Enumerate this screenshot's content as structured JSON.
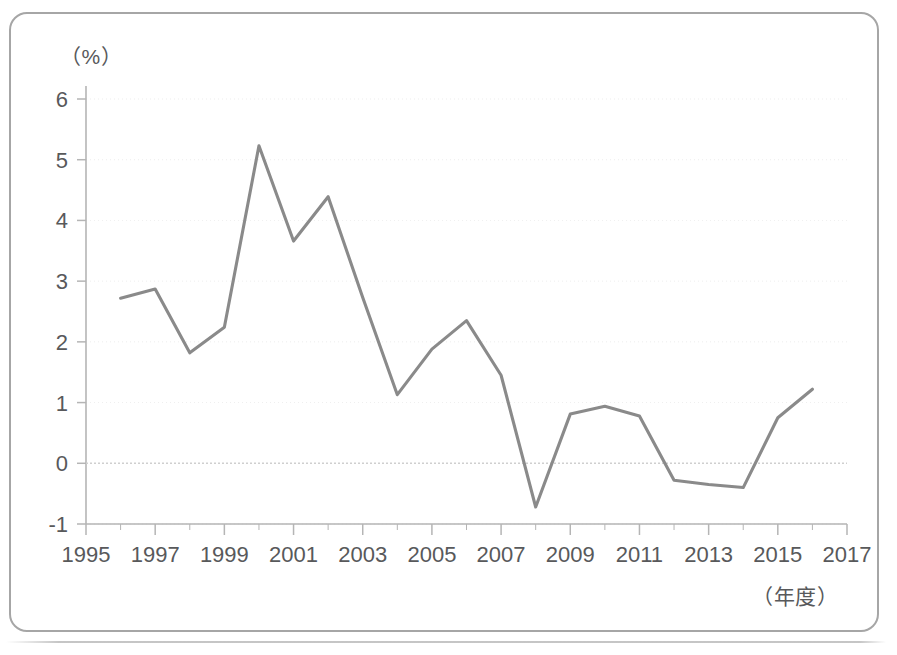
{
  "chart_data": {
    "type": "line",
    "title": "",
    "subtitle": "",
    "xlabel": "（年度）",
    "ylabel": "（%）",
    "unit_label": "（%）",
    "xaxis_caption": "（年度）",
    "grid": true,
    "legend": null,
    "legend_position": "none",
    "xlim": [
      1995,
      2017
    ],
    "ylim": [
      -1,
      6
    ],
    "ytick_labels": [
      "6",
      "5",
      "4",
      "3",
      "2",
      "1",
      "0",
      "-1"
    ],
    "ytick_values": [
      6,
      5,
      4,
      3,
      2,
      1,
      0,
      -1
    ],
    "xtick_labels": [
      "1995",
      "1997",
      "1999",
      "2001",
      "2003",
      "2005",
      "2007",
      "2009",
      "2011",
      "2013",
      "2015",
      "2017"
    ],
    "xtick_values": [
      1995,
      1997,
      1999,
      2001,
      2003,
      2005,
      2007,
      2009,
      2011,
      2013,
      2015,
      2017
    ],
    "x": [
      1996,
      1997,
      1998,
      1999,
      2000,
      2001,
      2002,
      2003,
      2004,
      2005,
      2006,
      2007,
      2008,
      2009,
      2010,
      2011,
      2012,
      2013,
      2014,
      2015,
      2016
    ],
    "values": [
      2.72,
      2.87,
      1.82,
      2.24,
      5.23,
      3.66,
      4.39,
      2.73,
      1.13,
      1.88,
      2.35,
      1.45,
      -0.72,
      0.81,
      0.94,
      0.78,
      -0.28,
      -0.35,
      -0.4,
      0.75,
      1.22
    ],
    "series": [
      {
        "name": "",
        "color": "#8a8a8a",
        "values": [
          2.72,
          2.87,
          1.82,
          2.24,
          5.23,
          3.66,
          4.39,
          2.73,
          1.13,
          1.88,
          2.35,
          1.45,
          -0.72,
          0.81,
          0.94,
          0.78,
          -0.28,
          -0.35,
          -0.4,
          0.75,
          1.22
        ]
      }
    ],
    "zero_line": 0,
    "colors": {
      "line": "#8a8a8a",
      "axis": "#b5b5b5",
      "grid": "#d9d9d9",
      "text": "#58595b",
      "border": "#a6a6a6",
      "background": "#ffffff"
    }
  }
}
